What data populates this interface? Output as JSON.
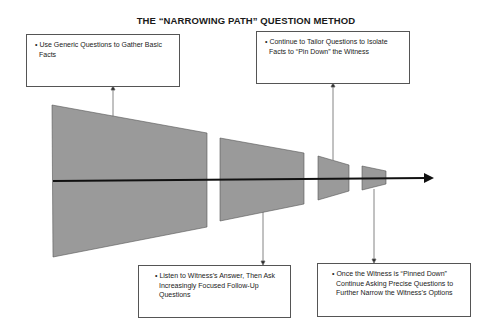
{
  "title": "THE “NARROWING PATH” QUESTION METHOD",
  "notes": [
    {
      "position": "top-left",
      "text": "• Use Generic Questions to Gather Basic Facts",
      "connects_to_stage": 1
    },
    {
      "position": "top-right",
      "text": "• Continue to Tailor Questions to Isolate Facts to “Pin Down” the Witness",
      "connects_to_stage": 3
    },
    {
      "position": "bottom-left",
      "text": "• Listen to Witness’s Answer, Then Ask Increasingly Focused Follow-Up Questions",
      "connects_to_stage": 2
    },
    {
      "position": "bottom-right",
      "text": "• Once the Witness is “Pinned Down” Continue Asking Precise Questions to Further Narrow the Witness’s Options",
      "connects_to_stage": 4
    }
  ],
  "stages": [
    {
      "id": 1,
      "shape": "trapezoid",
      "size": "largest"
    },
    {
      "id": 2,
      "shape": "trapezoid",
      "size": "large"
    },
    {
      "id": 3,
      "shape": "trapezoid",
      "size": "small"
    },
    {
      "id": 4,
      "shape": "trapezoid",
      "size": "smallest"
    }
  ],
  "path_arrow": {
    "direction": "right",
    "icon": "arrow-right-icon"
  },
  "colors": {
    "shape_fill": "#9a9a9a",
    "shape_stroke": "#555555",
    "arrow": "#111111",
    "connector": "#666666",
    "box_border": "#555555"
  }
}
